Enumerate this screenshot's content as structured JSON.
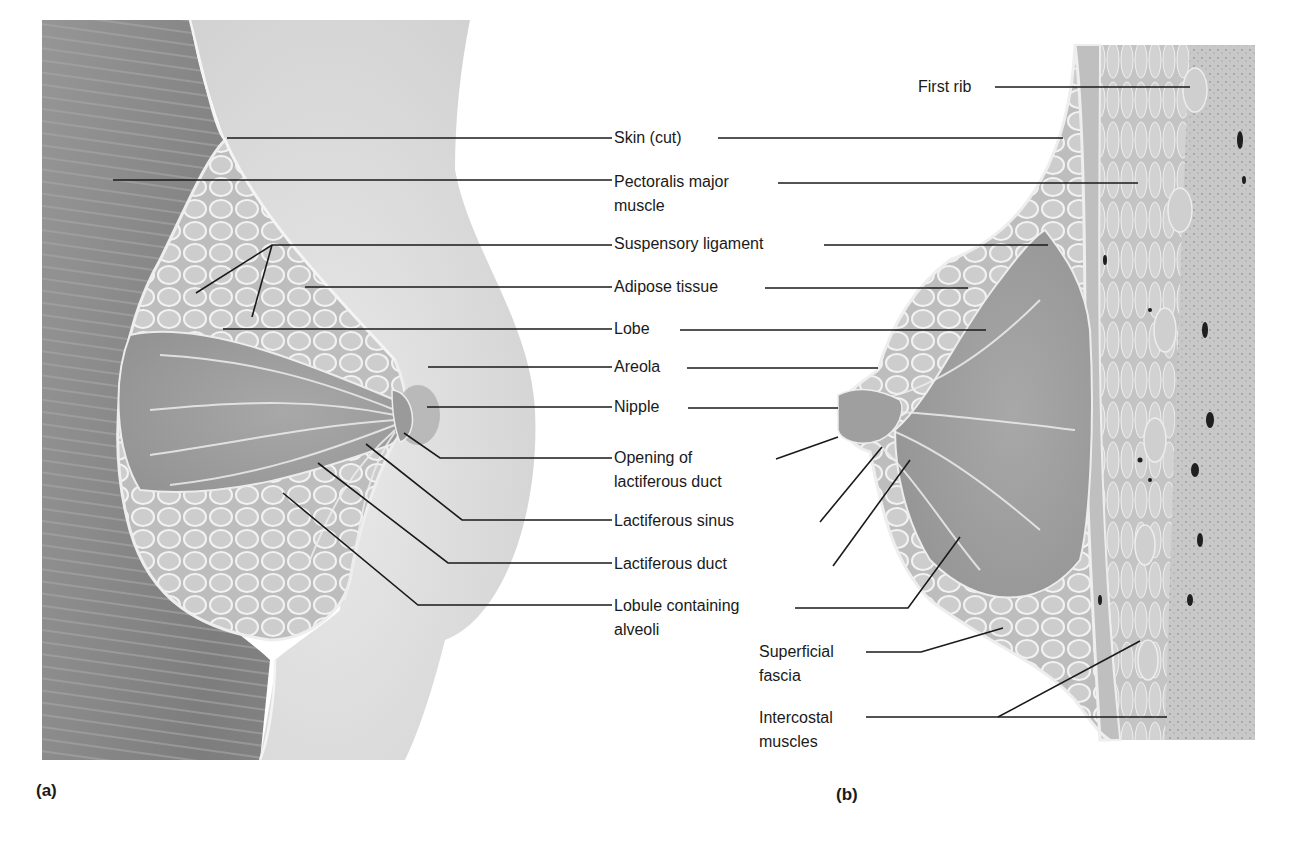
{
  "figure": {
    "panel_a": {
      "tag": "(a)",
      "view": "anterolateral cutaway"
    },
    "panel_b": {
      "tag": "(b)",
      "view": "sagittal section"
    },
    "center_labels": [
      {
        "id": "skin",
        "text": "Skin (cut)"
      },
      {
        "id": "pectoralis",
        "line1": "Pectoralis major",
        "line2": "muscle"
      },
      {
        "id": "suspensory",
        "text": "Suspensory ligament"
      },
      {
        "id": "adipose",
        "text": "Adipose tissue"
      },
      {
        "id": "lobe",
        "text": "Lobe"
      },
      {
        "id": "areola",
        "text": "Areola"
      },
      {
        "id": "nipple",
        "text": "Nipple"
      },
      {
        "id": "opening",
        "line1": "Opening of",
        "line2": "lactiferous duct"
      },
      {
        "id": "sinus",
        "text": "Lactiferous sinus"
      },
      {
        "id": "duct",
        "text": "Lactiferous duct"
      },
      {
        "id": "lobule",
        "line1": "Lobule containing",
        "line2": "alveoli"
      }
    ],
    "right_labels": [
      {
        "id": "first_rib",
        "text": "First rib"
      },
      {
        "id": "superficial_fascia",
        "line1": "Superficial",
        "line2": "fascia"
      },
      {
        "id": "intercostal",
        "line1": "Intercostal",
        "line2": "muscles"
      }
    ],
    "colors": {
      "leader": "#1a1a1a",
      "tissue_dark": "#8a8a8a",
      "tissue_mid": "#b4b4b4",
      "tissue_light": "#d8d8d8",
      "skin": "#e2e2e2"
    }
  }
}
